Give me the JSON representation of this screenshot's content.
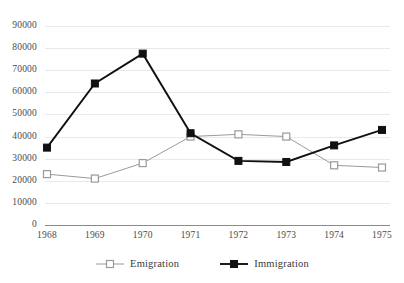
{
  "chart_data": {
    "type": "line",
    "title": "",
    "subtitle": "",
    "xlabel": "",
    "ylabel": "",
    "categories": [
      "1968",
      "1969",
      "1970",
      "1971",
      "1972",
      "1973",
      "1974",
      "1975"
    ],
    "ylim": [
      0,
      90000
    ],
    "ytick_labels": [
      "0",
      "10000",
      "20000",
      "30000",
      "40000",
      "50000",
      "60000",
      "70000",
      "80000",
      "90000"
    ],
    "ytick_values": [
      0,
      10000,
      20000,
      30000,
      40000,
      50000,
      60000,
      70000,
      80000,
      90000
    ],
    "grid": true,
    "legend_position": "bottom",
    "series": [
      {
        "name": "Emigration",
        "marker": "open-square",
        "color": "#9a9a9a",
        "values": [
          23000,
          21000,
          28000,
          40000,
          41000,
          40000,
          27000,
          26000
        ]
      },
      {
        "name": "Immigration",
        "marker": "filled-square",
        "color": "#111111",
        "values": [
          35000,
          64000,
          77500,
          41500,
          29000,
          28500,
          36000,
          43000
        ]
      }
    ]
  },
  "legend": {
    "items": [
      {
        "label": "Emigration"
      },
      {
        "label": "Immigration"
      }
    ]
  }
}
